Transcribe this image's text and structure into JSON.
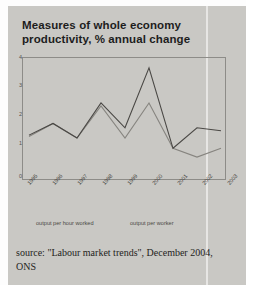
{
  "title": "Measures of whole economy productivity, % annual change",
  "source": "source: \"Labour market trends\", December 2004, ONS",
  "legend": {
    "series_a": "output per hour worked",
    "series_b": "output per worker"
  },
  "colors": {
    "paper": "#c9c8c4",
    "series_a": "#4a4845",
    "series_b": "#86847f",
    "axis": "#8d8c88",
    "title_text": "#1d1d1d"
  },
  "yticks": [
    "4",
    "3",
    "2",
    "1",
    "0"
  ],
  "chart_data": {
    "type": "line",
    "title": "Measures of whole economy productivity, % annual change",
    "xlabel": "",
    "ylabel": "% annual change",
    "categories": [
      "1995",
      "1996",
      "1997",
      "1998",
      "1999",
      "2000",
      "2001",
      "2002",
      "2003"
    ],
    "ylim": [
      0,
      4
    ],
    "ytick_values": [
      0,
      1,
      2,
      3,
      4
    ],
    "grid": false,
    "legend_position": "below-axis",
    "series": [
      {
        "name": "output per hour worked",
        "values": [
          1.5,
          1.9,
          1.4,
          2.6,
          1.75,
          3.8,
          1.05,
          1.75,
          1.65
        ]
      },
      {
        "name": "output per worker",
        "values": [
          1.45,
          1.9,
          1.4,
          2.5,
          1.4,
          2.6,
          1.05,
          0.75,
          1.05
        ]
      }
    ]
  }
}
